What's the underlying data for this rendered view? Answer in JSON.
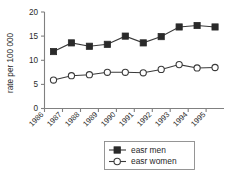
{
  "chart_data": {
    "type": "line",
    "title": "",
    "subtitle": "",
    "xlabel": "",
    "ylabel": "rate per 100 000",
    "categories": [
      "1986",
      "1987",
      "1988",
      "1989",
      "1990",
      "1991",
      "1992",
      "1993",
      "1994",
      "1995"
    ],
    "ylim": [
      0,
      20
    ],
    "yticks": [
      0,
      5,
      10,
      15,
      20
    ],
    "ytick_labels": [
      "0",
      "5",
      "10",
      "15",
      "20"
    ],
    "grid": false,
    "legend_position": "bottom-center",
    "series": [
      {
        "name": "easr men",
        "marker": "filled-square",
        "values": [
          11.8,
          13.6,
          12.9,
          13.3,
          15.0,
          13.6,
          14.9,
          16.9,
          17.2,
          16.9
        ]
      },
      {
        "name": "easr women",
        "marker": "open-circle",
        "values": [
          5.9,
          6.8,
          7.0,
          7.5,
          7.5,
          7.4,
          8.1,
          9.1,
          8.4,
          8.5
        ]
      }
    ],
    "colors": {
      "men_marker": "#2a2a2a",
      "women_marker": "#ffffff",
      "line": "#3a3a3a",
      "axis": "#808080",
      "text": "#1f1f1f",
      "background": "#ffffff"
    }
  },
  "axis": {
    "y_title": "rate per 100 000",
    "y_ticks": [
      "0",
      "5",
      "10",
      "15",
      "20"
    ],
    "x_ticks": [
      "1986",
      "1987",
      "1988",
      "1989",
      "1990",
      "1991",
      "1992",
      "1993",
      "1994",
      "1995"
    ]
  },
  "legend": {
    "items": [
      {
        "label": "easr men"
      },
      {
        "label": "easr women"
      }
    ]
  }
}
